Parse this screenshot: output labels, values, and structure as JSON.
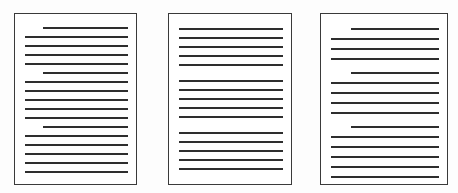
{
  "scene": {
    "title": "Three document pages with text lines",
    "background_color": "#fdfdfd",
    "page_background": "#ffffff",
    "page_border_color": "#3a3a3a",
    "text_line_color": "#2e2e2e",
    "page_count": 3
  },
  "documents": [
    {
      "name": "document-1",
      "label": "Document 1",
      "x": 14,
      "y": 13,
      "width": 123,
      "height": 172,
      "margin_left": 10,
      "margin_right": 10,
      "content_top": 13,
      "line_spacing": 9.2,
      "line_thickness": 2,
      "indent": 18,
      "line_count": 17,
      "paragraphs": [
        {
          "start_index": 0,
          "lines": 5,
          "indent_first": true
        },
        {
          "start_index": 5,
          "lines": 6,
          "indent_first": true
        },
        {
          "start_index": 11,
          "lines": 6,
          "indent_first": true
        }
      ],
      "lines": [
        {
          "index": 0,
          "indented": true,
          "y": 13
        },
        {
          "index": 1,
          "indented": false,
          "y": 22
        },
        {
          "index": 2,
          "indented": false,
          "y": 31
        },
        {
          "index": 3,
          "indented": false,
          "y": 40
        },
        {
          "index": 4,
          "indented": false,
          "y": 49
        },
        {
          "index": 5,
          "indented": true,
          "y": 58
        },
        {
          "index": 6,
          "indented": false,
          "y": 67
        },
        {
          "index": 7,
          "indented": false,
          "y": 76
        },
        {
          "index": 8,
          "indented": false,
          "y": 85
        },
        {
          "index": 9,
          "indented": false,
          "y": 94
        },
        {
          "index": 10,
          "indented": false,
          "y": 103
        },
        {
          "index": 11,
          "indented": true,
          "y": 112
        },
        {
          "index": 12,
          "indented": false,
          "y": 121
        },
        {
          "index": 13,
          "indented": false,
          "y": 130
        },
        {
          "index": 14,
          "indented": false,
          "y": 139
        },
        {
          "index": 15,
          "indented": false,
          "y": 148
        },
        {
          "index": 16,
          "indented": false,
          "y": 157
        }
      ]
    },
    {
      "name": "document-2",
      "label": "Document 2",
      "x": 168,
      "y": 13,
      "width": 124,
      "height": 172,
      "margin_left": 10,
      "margin_right": 10,
      "content_top": 14,
      "line_spacing": 9.2,
      "line_thickness": 2,
      "indent": 0,
      "line_count": 15,
      "paragraphs": [
        {
          "start_index": 0,
          "lines": 5,
          "indent_first": false
        },
        {
          "start_index": 5,
          "lines": 5,
          "indent_first": false
        },
        {
          "start_index": 10,
          "lines": 5,
          "indent_first": false
        }
      ],
      "lines": [
        {
          "index": 0,
          "indented": false,
          "y": 14
        },
        {
          "index": 1,
          "indented": false,
          "y": 23
        },
        {
          "index": 2,
          "indented": false,
          "y": 32
        },
        {
          "index": 3,
          "indented": false,
          "y": 41
        },
        {
          "index": 4,
          "indented": false,
          "y": 50
        },
        {
          "index": 5,
          "indented": false,
          "y": 66
        },
        {
          "index": 6,
          "indented": false,
          "y": 75
        },
        {
          "index": 7,
          "indented": false,
          "y": 84
        },
        {
          "index": 8,
          "indented": false,
          "y": 93
        },
        {
          "index": 9,
          "indented": false,
          "y": 102
        },
        {
          "index": 10,
          "indented": false,
          "y": 118
        },
        {
          "index": 11,
          "indented": false,
          "y": 127
        },
        {
          "index": 12,
          "indented": false,
          "y": 136
        },
        {
          "index": 13,
          "indented": false,
          "y": 145
        },
        {
          "index": 14,
          "indented": false,
          "y": 154
        }
      ]
    },
    {
      "name": "document-3",
      "label": "Document 3",
      "x": 320,
      "y": 13,
      "width": 128,
      "height": 172,
      "margin_left": 10,
      "margin_right": 10,
      "content_top": 14,
      "line_spacing": 9.6,
      "line_thickness": 2,
      "indent": 20,
      "line_count": 15,
      "paragraphs": [
        {
          "start_index": 0,
          "lines": 4,
          "indent_first": true
        },
        {
          "start_index": 4,
          "lines": 5,
          "indent_first": true
        },
        {
          "start_index": 9,
          "lines": 6,
          "indent_first": true
        }
      ],
      "lines": [
        {
          "index": 0,
          "indented": true,
          "y": 14
        },
        {
          "index": 1,
          "indented": false,
          "y": 24
        },
        {
          "index": 2,
          "indented": false,
          "y": 34
        },
        {
          "index": 3,
          "indented": false,
          "y": 44
        },
        {
          "index": 4,
          "indented": true,
          "y": 58
        },
        {
          "index": 5,
          "indented": false,
          "y": 68
        },
        {
          "index": 6,
          "indented": false,
          "y": 78
        },
        {
          "index": 7,
          "indented": false,
          "y": 88
        },
        {
          "index": 8,
          "indented": false,
          "y": 98
        },
        {
          "index": 9,
          "indented": true,
          "y": 112
        },
        {
          "index": 10,
          "indented": false,
          "y": 122
        },
        {
          "index": 11,
          "indented": false,
          "y": 132
        },
        {
          "index": 12,
          "indented": false,
          "y": 142
        },
        {
          "index": 13,
          "indented": false,
          "y": 152
        },
        {
          "index": 14,
          "indented": false,
          "y": 162
        }
      ]
    }
  ]
}
